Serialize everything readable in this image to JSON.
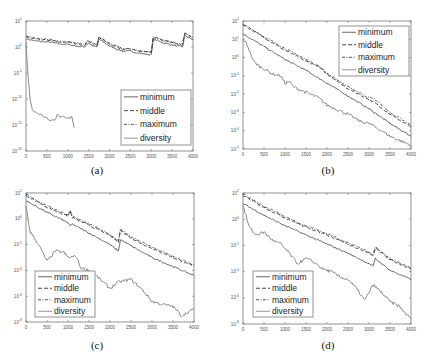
{
  "figure": {
    "captions": [
      "(a)",
      "(b)",
      "(c)",
      "(d)"
    ]
  },
  "chart_data": [
    {
      "panel": "(a)",
      "type": "line",
      "title": "",
      "xlabel": "",
      "ylabel": "",
      "yscale": "log",
      "xlim": [
        0,
        4000
      ],
      "ylim_exp": [
        -20,
        5
      ],
      "x_ticks": [
        0,
        500,
        1000,
        1500,
        2000,
        2500,
        3000,
        3500,
        4000
      ],
      "y_ticks": [
        "10^5",
        "10^0",
        "10^-5",
        "10^-10",
        "10^-15",
        "10^-20"
      ],
      "y_tick_exps": [
        5,
        0,
        -5,
        -10,
        -15,
        -20
      ],
      "grid": false,
      "legend": {
        "position": "lower-right",
        "entries": [
          "minimum",
          "middle",
          "maximum",
          "diversity"
        ]
      },
      "series": [
        {
          "name": "minimum",
          "x": [
            0,
            200,
            400,
            600,
            800,
            1000,
            1200,
            1400,
            1500,
            1600,
            1700,
            1750,
            2000,
            2300,
            2500,
            2600,
            2800,
            3000,
            3050,
            3300,
            3600,
            3750,
            3800,
            4000
          ],
          "y_exp": [
            1.6,
            1.2,
            1.0,
            0.9,
            0.6,
            0.5,
            0.2,
            0,
            0.8,
            0.2,
            0,
            1.5,
            0.2,
            -0.8,
            -0.8,
            -1.0,
            -1.3,
            -1.5,
            1.5,
            0.8,
            0.2,
            0,
            2.2,
            1.4
          ]
        },
        {
          "name": "middle",
          "x": [
            0,
            200,
            400,
            600,
            800,
            1000,
            1200,
            1400,
            1500,
            1600,
            1700,
            1750,
            2000,
            2300,
            2500,
            2600,
            2800,
            3000,
            3050,
            3300,
            3600,
            3750,
            3800,
            4000
          ],
          "y_exp": [
            2.0,
            1.6,
            1.4,
            1.3,
            1.0,
            0.9,
            0.6,
            0.4,
            1.2,
            0.6,
            0.4,
            1.9,
            0.6,
            -0.4,
            -0.4,
            -0.6,
            -0.9,
            -1.1,
            1.9,
            1.2,
            0.6,
            0.4,
            2.6,
            1.8
          ]
        },
        {
          "name": "maximum",
          "x": [
            0,
            200,
            400,
            600,
            800,
            1000,
            1200,
            1400,
            1500,
            1600,
            1700,
            1750,
            2000,
            2300,
            2500,
            2600,
            2800,
            3000,
            3050,
            3300,
            3600,
            3750,
            3800,
            4000
          ],
          "y_exp": [
            2.1,
            1.7,
            1.5,
            1.4,
            1.1,
            1.0,
            0.7,
            0.5,
            1.3,
            0.7,
            0.5,
            2.0,
            0.7,
            -0.3,
            -0.3,
            -0.5,
            -0.8,
            -1.0,
            2.0,
            1.3,
            0.7,
            0.5,
            2.7,
            1.9
          ]
        },
        {
          "name": "diversity",
          "x": [
            0,
            20,
            50,
            100,
            150,
            200,
            300,
            400,
            500,
            600,
            700,
            750,
            800,
            900,
            1000,
            1100,
            1150
          ],
          "y_exp": [
            1,
            -2,
            -6,
            -10,
            -12,
            -12.5,
            -12.8,
            -13.2,
            -13.8,
            -14.2,
            -13.8,
            -12.8,
            -13.6,
            -13.2,
            -13.6,
            -13.4,
            -15.5
          ]
        }
      ]
    },
    {
      "panel": "(b)",
      "type": "line",
      "title": "",
      "xlabel": "",
      "ylabel": "",
      "yscale": "log",
      "xlim": [
        0,
        4000
      ],
      "ylim_exp": [
        -5,
        2
      ],
      "x_ticks": [
        0,
        500,
        1000,
        1500,
        2000,
        2500,
        3000,
        3500,
        4000
      ],
      "y_ticks": [
        "10^2",
        "10^1",
        "10^0",
        "10^-1",
        "10^-2",
        "10^-3",
        "10^-4",
        "10^-5"
      ],
      "y_tick_exps": [
        2,
        1,
        0,
        -1,
        -2,
        -3,
        -4,
        -5
      ],
      "grid": false,
      "legend": {
        "position": "upper-right",
        "entries": [
          "minimum",
          "middle",
          "maximum",
          "diversity"
        ]
      },
      "series": [
        {
          "name": "minimum",
          "x": [
            0,
            500,
            1000,
            1500,
            2000,
            2500,
            3000,
            3500,
            4000
          ],
          "y_exp": [
            1.3,
            0.6,
            -0.1,
            -0.7,
            -1.4,
            -2.1,
            -2.8,
            -3.6,
            -4.3
          ]
        },
        {
          "name": "middle",
          "x": [
            0,
            500,
            1000,
            1500,
            1800,
            2000,
            2500,
            3000,
            3100,
            3500,
            4000
          ],
          "y_exp": [
            1.8,
            1.1,
            0.4,
            -0.2,
            -0.5,
            -0.9,
            -1.7,
            -2.3,
            -2.4,
            -3.1,
            -3.8
          ]
        },
        {
          "name": "maximum",
          "x": [
            0,
            500,
            1000,
            1500,
            1800,
            2000,
            2500,
            3000,
            3100,
            3500,
            4000
          ],
          "y_exp": [
            1.85,
            1.15,
            0.5,
            -0.1,
            -0.45,
            -0.85,
            -1.6,
            -2.2,
            -2.2,
            -3.0,
            -3.7
          ]
        },
        {
          "name": "diversity",
          "x": [
            0,
            100,
            250,
            400,
            500,
            700,
            900,
            1000,
            1100,
            1200,
            1500,
            1800,
            2000,
            2300,
            2500,
            2800,
            3000,
            3300,
            3500,
            3800,
            4000
          ],
          "y_exp": [
            1.0,
            0.7,
            -0.2,
            -0.5,
            -0.6,
            -0.9,
            -1.0,
            -1.4,
            -1.3,
            -1.6,
            -1.9,
            -2.2,
            -2.6,
            -2.9,
            -3.1,
            -3.5,
            -3.6,
            -4.0,
            -4.3,
            -4.6,
            -4.8
          ]
        }
      ]
    },
    {
      "panel": "(c)",
      "type": "line",
      "title": "",
      "xlabel": "",
      "ylabel": "",
      "yscale": "log",
      "xlim": [
        0,
        4000
      ],
      "ylim_exp": [
        -8,
        2
      ],
      "x_ticks": [
        0,
        500,
        1000,
        1500,
        2000,
        2500,
        3000,
        3500,
        4000
      ],
      "y_ticks": [
        "10^2",
        "10^0",
        "10^-2",
        "10^-4",
        "10^-6",
        "10^-8"
      ],
      "y_tick_exps": [
        2,
        0,
        -2,
        -4,
        -6,
        -8
      ],
      "grid": false,
      "legend": {
        "position": "lower-left",
        "entries": [
          "minimum",
          "middle",
          "maximum",
          "diversity"
        ]
      },
      "series": [
        {
          "name": "minimum",
          "x": [
            0,
            500,
            1000,
            1050,
            1100,
            1500,
            2000,
            2200,
            2250,
            2500,
            3000,
            3500,
            4000
          ],
          "y_exp": [
            1.4,
            0.5,
            -0.3,
            -0.6,
            -0.4,
            -1.1,
            -2.0,
            -2.5,
            -1.6,
            -2.1,
            -3.0,
            -3.7,
            -4.4
          ]
        },
        {
          "name": "middle",
          "x": [
            0,
            500,
            1000,
            1050,
            1100,
            1500,
            2000,
            2200,
            2250,
            2500,
            3000,
            3500,
            4000
          ],
          "y_exp": [
            1.8,
            0.9,
            0.2,
            0.6,
            0.1,
            -0.5,
            -1.3,
            -1.8,
            -0.9,
            -1.5,
            -2.3,
            -3.0,
            -3.7
          ]
        },
        {
          "name": "maximum",
          "x": [
            0,
            500,
            1000,
            1050,
            1100,
            1500,
            2000,
            2200,
            2250,
            2500,
            3000,
            3500,
            4000
          ],
          "y_exp": [
            1.9,
            1.0,
            0.3,
            0.7,
            0.2,
            -0.4,
            -1.2,
            -1.7,
            -0.8,
            -1.4,
            -2.2,
            -2.9,
            -3.6
          ]
        },
        {
          "name": "diversity",
          "x": [
            0,
            100,
            300,
            500,
            700,
            900,
            1000,
            1200,
            1300,
            1500,
            1700,
            2000,
            2200,
            2500,
            2800,
            3000,
            3200,
            3500,
            3700,
            4000
          ],
          "y_exp": [
            1.0,
            -1.0,
            -2.0,
            -3.3,
            -2.5,
            -2.6,
            -3.0,
            -2.9,
            -3.8,
            -4.0,
            -4.5,
            -5.4,
            -4.9,
            -4.7,
            -5.6,
            -6.4,
            -6.6,
            -6.8,
            -7.5,
            -7.0
          ]
        }
      ]
    },
    {
      "panel": "(d)",
      "type": "line",
      "title": "",
      "xlabel": "",
      "ylabel": "",
      "yscale": "log",
      "xlim": [
        0,
        4000
      ],
      "ylim_exp": [
        -8,
        2
      ],
      "x_ticks": [
        0,
        500,
        1000,
        1500,
        2000,
        2500,
        3000,
        3500,
        4000
      ],
      "y_ticks": [
        "10^2",
        "10^0",
        "10^-2",
        "10^-4",
        "10^-6",
        "10^-8"
      ],
      "y_tick_exps": [
        2,
        0,
        -2,
        -4,
        -6,
        -8
      ],
      "grid": false,
      "legend": {
        "position": "lower-left",
        "entries": [
          "minimum",
          "middle",
          "maximum",
          "diversity"
        ]
      },
      "series": [
        {
          "name": "minimum",
          "x": [
            0,
            500,
            1000,
            1500,
            2000,
            2500,
            3000,
            3100,
            3150,
            3500,
            4000
          ],
          "y_exp": [
            1.2,
            0.3,
            -0.5,
            -1.2,
            -1.9,
            -2.6,
            -3.4,
            -3.6,
            -3.0,
            -3.9,
            -4.6
          ]
        },
        {
          "name": "middle",
          "x": [
            0,
            500,
            1000,
            1500,
            2000,
            2500,
            3000,
            3100,
            3150,
            3500,
            4000
          ],
          "y_exp": [
            1.8,
            0.9,
            0.1,
            -0.6,
            -1.2,
            -1.9,
            -2.6,
            -2.8,
            -2.2,
            -3.1,
            -3.8
          ]
        },
        {
          "name": "maximum",
          "x": [
            0,
            500,
            1000,
            1500,
            2000,
            2500,
            3000,
            3100,
            3150,
            3500,
            4000
          ],
          "y_exp": [
            1.9,
            1.0,
            0.2,
            -0.5,
            -1.1,
            -1.8,
            -2.5,
            -2.7,
            -2.1,
            -3.0,
            -3.7
          ]
        },
        {
          "name": "diversity",
          "x": [
            0,
            150,
            300,
            500,
            700,
            900,
            1100,
            1300,
            1500,
            1700,
            1900,
            2100,
            2300,
            2500,
            2700,
            2900,
            3100,
            3300,
            3500,
            3700,
            3900,
            4000
          ],
          "y_exp": [
            1.0,
            -0.6,
            -1.2,
            -1.0,
            -1.6,
            -1.9,
            -2.6,
            -3.4,
            -3.0,
            -3.3,
            -3.8,
            -4.0,
            -4.4,
            -4.6,
            -5.3,
            -6.2,
            -5.0,
            -5.6,
            -6.3,
            -6.6,
            -7.3,
            -7.6
          ]
        }
      ]
    }
  ],
  "layout": {
    "panels": [
      {
        "left": 26,
        "top": 21,
        "width": 167,
        "height": 130,
        "caption_x": 77,
        "caption_y": 165
      },
      {
        "left": 243,
        "top": 21,
        "width": 168,
        "height": 128,
        "caption_x": 308,
        "caption_y": 165
      },
      {
        "left": 26,
        "top": 193,
        "width": 168,
        "height": 129,
        "caption_x": 77,
        "caption_y": 340
      },
      {
        "left": 243,
        "top": 193,
        "width": 168,
        "height": 131,
        "caption_x": 308,
        "caption_y": 340
      }
    ],
    "legend_boxes": [
      {
        "x": 121,
        "y": 90,
        "w": 70,
        "h": 55
      },
      {
        "x": 339,
        "y": 26,
        "w": 70,
        "h": 50
      },
      {
        "x": 35,
        "y": 271,
        "w": 60,
        "h": 46
      },
      {
        "x": 253,
        "y": 271,
        "w": 60,
        "h": 46
      }
    ],
    "series_styles": {
      "minimum": {
        "color": "#555555",
        "dash": "",
        "width": 0.9
      },
      "middle": {
        "color": "#333333",
        "dash": "4,2",
        "width": 0.9
      },
      "maximum": {
        "color": "#444444",
        "dash": "3,1.5,1,1.5",
        "width": 0.9
      },
      "diversity": {
        "color": "#8a8a8a",
        "dash": "",
        "width": 1.0
      }
    }
  }
}
